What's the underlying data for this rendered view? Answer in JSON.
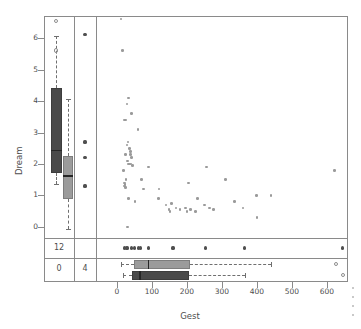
{
  "chart_data": {
    "type": "scatter",
    "title": "",
    "xlabel": "Gest",
    "ylabel": "Dream",
    "xlim": [
      -60,
      660
    ],
    "ylim": [
      -0.35,
      6.7
    ],
    "xticks": [
      0,
      100,
      200,
      300,
      400,
      500,
      600
    ],
    "yticks": [
      0,
      1,
      2,
      3,
      4,
      5,
      6
    ],
    "grid": false,
    "legend": "none",
    "points": [
      {
        "x": 12,
        "y": 6.6
      },
      {
        "x": 15,
        "y": 5.6
      },
      {
        "x": 33,
        "y": 4.1
      },
      {
        "x": 28,
        "y": 3.9
      },
      {
        "x": 42,
        "y": 3.6
      },
      {
        "x": 21,
        "y": 3.4
      },
      {
        "x": 24,
        "y": 3.4
      },
      {
        "x": 60,
        "y": 3.1
      },
      {
        "x": 31,
        "y": 2.7
      },
      {
        "x": 28,
        "y": 2.6
      },
      {
        "x": 35,
        "y": 2.5
      },
      {
        "x": 39,
        "y": 2.4
      },
      {
        "x": 25,
        "y": 2.3
      },
      {
        "x": 38,
        "y": 2.3
      },
      {
        "x": 42,
        "y": 2.2
      },
      {
        "x": 30,
        "y": 2.1
      },
      {
        "x": 33,
        "y": 2.0
      },
      {
        "x": 36,
        "y": 2.0
      },
      {
        "x": 40,
        "y": 2.0
      },
      {
        "x": 44,
        "y": 1.95
      },
      {
        "x": 19,
        "y": 1.8
      },
      {
        "x": 90,
        "y": 1.9
      },
      {
        "x": 255,
        "y": 1.9
      },
      {
        "x": 622,
        "y": 1.8
      },
      {
        "x": 26,
        "y": 1.5
      },
      {
        "x": 70,
        "y": 1.5
      },
      {
        "x": 21,
        "y": 1.4
      },
      {
        "x": 23,
        "y": 1.35
      },
      {
        "x": 22,
        "y": 1.3
      },
      {
        "x": 24,
        "y": 1.25
      },
      {
        "x": 205,
        "y": 1.4
      },
      {
        "x": 310,
        "y": 1.5
      },
      {
        "x": 75,
        "y": 1.2
      },
      {
        "x": 120,
        "y": 1.2
      },
      {
        "x": 33,
        "y": 0.9
      },
      {
        "x": 52,
        "y": 0.8
      },
      {
        "x": 118,
        "y": 0.9
      },
      {
        "x": 140,
        "y": 0.7
      },
      {
        "x": 155,
        "y": 0.75
      },
      {
        "x": 168,
        "y": 0.6
      },
      {
        "x": 180,
        "y": 0.55
      },
      {
        "x": 195,
        "y": 0.6
      },
      {
        "x": 200,
        "y": 0.5
      },
      {
        "x": 210,
        "y": 0.55
      },
      {
        "x": 225,
        "y": 0.5
      },
      {
        "x": 230,
        "y": 0.9
      },
      {
        "x": 250,
        "y": 0.7
      },
      {
        "x": 265,
        "y": 0.6
      },
      {
        "x": 275,
        "y": 0.55
      },
      {
        "x": 335,
        "y": 0.8
      },
      {
        "x": 360,
        "y": 0.6
      },
      {
        "x": 398,
        "y": 1.0
      },
      {
        "x": 440,
        "y": 1.0
      },
      {
        "x": 400,
        "y": 0.3
      },
      {
        "x": 148,
        "y": 0.55
      },
      {
        "x": 152,
        "y": 0.5
      },
      {
        "x": 30,
        "y": 0.0
      }
    ],
    "missing_x_points": [
      {
        "y": 6.1
      },
      {
        "y": 2.7
      },
      {
        "y": 2.2
      },
      {
        "y": 1.3
      }
    ],
    "missing_y_points": [
      {
        "x": 22
      },
      {
        "x": 26
      },
      {
        "x": 30
      },
      {
        "x": 42
      },
      {
        "x": 50
      },
      {
        "x": 62
      },
      {
        "x": 66
      },
      {
        "x": 90
      },
      {
        "x": 160
      },
      {
        "x": 252
      },
      {
        "x": 365
      },
      {
        "x": 645
      }
    ],
    "counts": {
      "missing_y_label": "12",
      "missing_both_label": "0",
      "missing_x_label": "4"
    },
    "boxplots": {
      "dream_missing_gest": {
        "orientation": "vertical",
        "color": "#4a4a4a",
        "lower_whisker": 1.35,
        "q1": 1.7,
        "median": 2.45,
        "q3": 4.4,
        "upper_whisker": 6.05,
        "outliers": [
          6.55,
          5.6
        ]
      },
      "dream_observed": {
        "orientation": "vertical",
        "color": "#9b9b9b",
        "lower_whisker": -0.05,
        "q1": 0.9,
        "median": 1.65,
        "q3": 2.25,
        "upper_whisker": 4.05,
        "outliers": []
      },
      "gest_observed": {
        "orientation": "horizontal",
        "color": "#9b9b9b",
        "lower_whisker": 12,
        "q1": 49,
        "median": 88,
        "q3": 208,
        "upper_whisker": 440,
        "outliers": [
          625
        ]
      },
      "gest_missing_dream": {
        "orientation": "horizontal",
        "color": "#4a4a4a",
        "lower_whisker": 17,
        "q1": 42,
        "median": 63,
        "q3": 205,
        "upper_whisker": 365,
        "outliers": [
          645
        ]
      }
    }
  }
}
